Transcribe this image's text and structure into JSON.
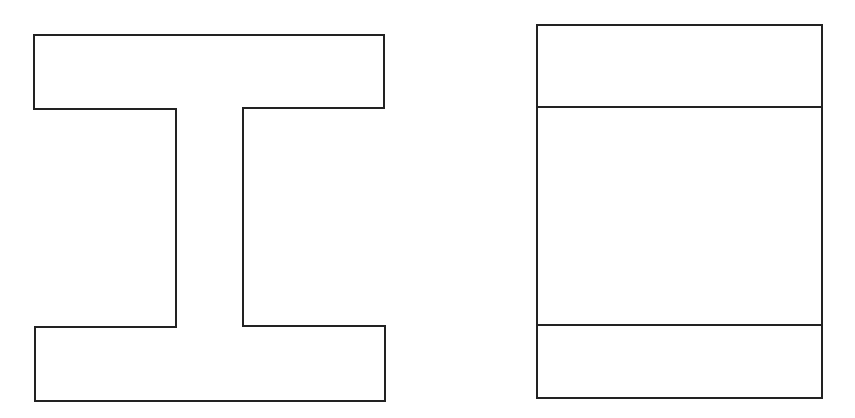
{
  "diagram": {
    "stroke_color": "#222222",
    "background": "#ffffff",
    "stroke_width": 2,
    "shapes": [
      {
        "name": "i-beam-section",
        "type": "polygon",
        "points": "34,35 384,35 384,108 243,108 243,326 385,326 385,401 35,401 35,327 176,327 176,109 34,109"
      },
      {
        "name": "divided-rectangle",
        "type": "rect",
        "x": 537,
        "y": 25,
        "width": 285,
        "height": 373,
        "dividers_y": [
          107,
          325
        ]
      }
    ]
  }
}
